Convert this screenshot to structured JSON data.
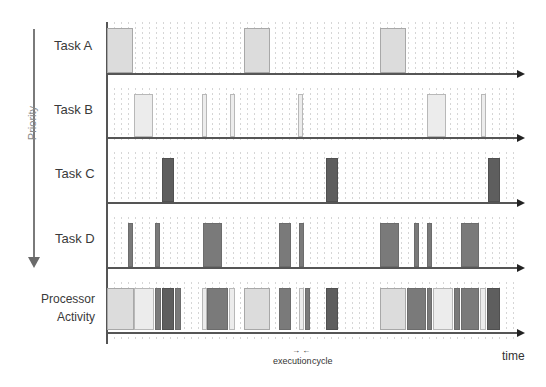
{
  "diagram": {
    "type": "priority-scheduling-timeline",
    "priority_axis": {
      "label": "Priority",
      "direction": "down"
    },
    "time_axis": {
      "label": "time"
    },
    "annotation": {
      "left": "execution",
      "right": "cycle",
      "arrows": "→ ←"
    },
    "tasks": [
      {
        "name": "Task  A",
        "shade": "#dcdcdc",
        "axis_y": 73,
        "segments": [
          [
            107,
            133
          ],
          [
            244,
            270
          ],
          [
            380,
            406
          ]
        ],
        "top": 28
      },
      {
        "name": "Task  B",
        "shade": "#ececec",
        "axis_y": 137,
        "segments": [
          [
            134,
            153
          ],
          [
            202,
            207
          ],
          [
            230,
            235
          ],
          [
            298,
            303
          ],
          [
            427,
            446
          ],
          [
            481,
            486
          ]
        ],
        "top": 94
      },
      {
        "name": "Task  C",
        "shade": "#5e5e5e",
        "axis_y": 202,
        "segments": [
          [
            162,
            174
          ],
          [
            326,
            338
          ],
          [
            488,
            500
          ]
        ],
        "top": 158
      },
      {
        "name": "Task  D",
        "shade": "#7a7a7a",
        "axis_y": 267,
        "segments": [
          [
            128,
            133
          ],
          [
            155,
            160
          ],
          [
            203,
            222
          ],
          [
            279,
            291
          ],
          [
            299,
            304
          ],
          [
            380,
            399
          ],
          [
            414,
            419
          ],
          [
            427,
            432
          ],
          [
            461,
            479
          ]
        ],
        "top": 223
      }
    ],
    "processor": {
      "label_line1": "Processor",
      "label_line2": "Activity",
      "axis_y": 332,
      "top": 288,
      "segments": [
        {
          "task": "A",
          "x": [
            107,
            134
          ]
        },
        {
          "task": "B",
          "x": [
            134,
            154
          ]
        },
        {
          "task": "D",
          "x": [
            155,
            161
          ]
        },
        {
          "task": "C",
          "x": [
            162,
            174
          ]
        },
        {
          "task": "D",
          "x": [
            175,
            181
          ]
        },
        {
          "task": "B",
          "x": [
            202,
            207
          ]
        },
        {
          "task": "D",
          "x": [
            207,
            228
          ]
        },
        {
          "task": "B",
          "x": [
            229,
            235
          ]
        },
        {
          "task": "A",
          "x": [
            244,
            270
          ]
        },
        {
          "task": "D",
          "x": [
            279,
            291
          ]
        },
        {
          "task": "B",
          "x": [
            299,
            304
          ]
        },
        {
          "task": "D",
          "x": [
            305,
            310
          ]
        },
        {
          "task": "C",
          "x": [
            326,
            338
          ]
        },
        {
          "task": "A",
          "x": [
            380,
            406
          ]
        },
        {
          "task": "D",
          "x": [
            407,
            426
          ]
        },
        {
          "task": "D",
          "x": [
            427,
            432
          ]
        },
        {
          "task": "B",
          "x": [
            433,
            453
          ]
        },
        {
          "task": "D",
          "x": [
            454,
            460
          ]
        },
        {
          "task": "D",
          "x": [
            461,
            479
          ]
        },
        {
          "task": "B",
          "x": [
            480,
            486
          ]
        },
        {
          "task": "C",
          "x": [
            487,
            500
          ]
        }
      ]
    }
  }
}
